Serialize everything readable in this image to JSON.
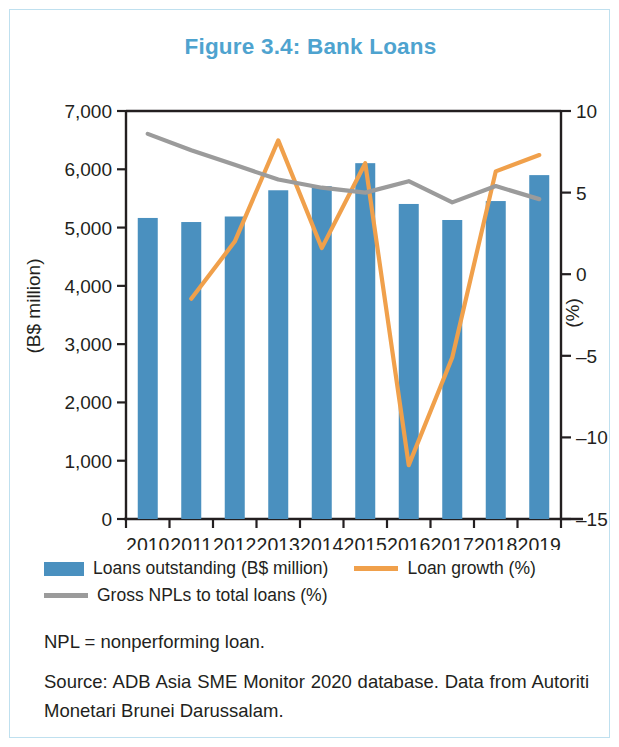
{
  "figure": {
    "title": "Figure 3.4: Bank Loans",
    "title_color": "#4ea3cf",
    "border_color": "#bfe0ef"
  },
  "notes": {
    "abbreviation": "NPL = nonperforming loan.",
    "source": "Source: ADB Asia SME Monitor 2020 database. Data from Autoriti Monetari Brunei Darussalam."
  },
  "legend": {
    "items": [
      {
        "label": "Loans outstanding (B$ million)",
        "marker": "bar-swatch",
        "color": "#4a90bf"
      },
      {
        "label": "Loan growth (%)",
        "marker": "line-swatch",
        "color": "#f0a04b"
      },
      {
        "label": "Gross NPLs to total loans (%)",
        "marker": "line-swatch",
        "color": "#9b9b9b"
      }
    ]
  },
  "chart_data": {
    "type": "bar",
    "title": "Figure 3.4: Bank Loans",
    "xlabel": "",
    "ylabel": "(B$ million)",
    "y2label": "(%)",
    "categories": [
      "2010",
      "2011",
      "2012",
      "2013",
      "2014",
      "2015",
      "2016",
      "2017",
      "2018",
      "2019"
    ],
    "ylim": [
      0,
      7000
    ],
    "y2lim": [
      -15,
      10
    ],
    "yticks": [
      "0",
      "1,000",
      "2,000",
      "3,000",
      "4,000",
      "5,000",
      "6,000",
      "7,000"
    ],
    "y2ticks": [
      "-15",
      "-10",
      "-5",
      "0",
      "5",
      "10"
    ],
    "grid": false,
    "legend_position": "bottom-left",
    "series": [
      {
        "name": "Loans outstanding (B$ million)",
        "type": "bar",
        "axis": "left",
        "color": "#4a90bf",
        "values": [
          5165,
          5095,
          5190,
          5640,
          5710,
          6105,
          5405,
          5130,
          5455,
          5900
        ]
      },
      {
        "name": "Loan growth (%)",
        "type": "line",
        "axis": "right",
        "color": "#f0a04b",
        "values": [
          null,
          -1.5,
          2.0,
          8.2,
          1.6,
          6.8,
          -11.7,
          -5.1,
          6.3,
          7.3
        ]
      },
      {
        "name": "Gross NPLs to total loans (%)",
        "type": "line",
        "axis": "right",
        "color": "#9b9b9b",
        "values": [
          8.6,
          7.6,
          6.7,
          5.8,
          5.3,
          5.0,
          5.7,
          4.4,
          5.4,
          4.6
        ]
      }
    ]
  }
}
